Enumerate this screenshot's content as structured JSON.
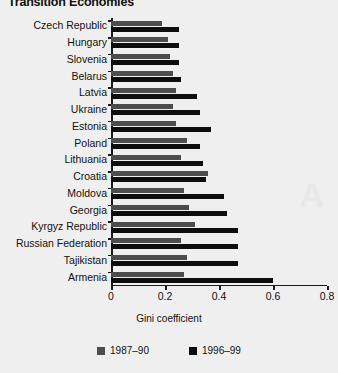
{
  "title": "Transition Economies",
  "axis": {
    "x_title": "Gini coefficient",
    "x_ticks": [
      "0",
      "0.2",
      "0.4",
      "0.6",
      "0.8"
    ]
  },
  "legend": {
    "items": [
      {
        "label": "1987–90",
        "color": "#4d4d4d"
      },
      {
        "label": "1996–99",
        "color": "#0d0d0d"
      }
    ]
  },
  "chart_data": {
    "type": "bar",
    "orientation": "horizontal",
    "title": "Transition Economies",
    "xlabel": "Gini coefficient",
    "ylabel": "",
    "xlim": [
      0,
      0.8
    ],
    "xticks": [
      0,
      0.2,
      0.4,
      0.6,
      0.8
    ],
    "grid": false,
    "legend_position": "bottom",
    "categories": [
      "Czech Republic",
      "Hungary",
      "Slovenia",
      "Belarus",
      "Latvia",
      "Ukraine",
      "Estonia",
      "Poland",
      "Lithuania",
      "Croatia",
      "Moldova",
      "Georgia",
      "Kyrgyz Republic",
      "Russian Federation",
      "Tajikistan",
      "Armenia"
    ],
    "series": [
      {
        "name": "1987–90",
        "color": "#4d4d4d",
        "values": [
          0.19,
          0.21,
          0.22,
          0.23,
          0.24,
          0.23,
          0.24,
          0.28,
          0.26,
          0.36,
          0.27,
          0.29,
          0.31,
          0.26,
          0.28,
          0.27
        ]
      },
      {
        "name": "1996–99",
        "color": "#0d0d0d",
        "values": [
          0.25,
          0.25,
          0.25,
          0.26,
          0.32,
          0.33,
          0.37,
          0.33,
          0.34,
          0.35,
          0.42,
          0.43,
          0.47,
          0.47,
          0.47,
          0.6
        ]
      }
    ]
  }
}
